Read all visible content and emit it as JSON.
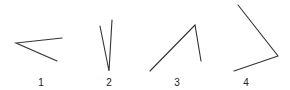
{
  "diagram": {
    "title": "",
    "stroke_color": "#333333",
    "angles": [
      {
        "label": "1",
        "vertex": [
          16,
          43
        ],
        "ray_a": [
          62,
          38
        ],
        "ray_b": [
          57,
          61
        ],
        "label_pos": [
          41,
          86
        ]
      },
      {
        "label": "2",
        "vertex": [
          109,
          71
        ],
        "ray_a": [
          100,
          26
        ],
        "ray_b": [
          112,
          20
        ],
        "label_pos": [
          109,
          86
        ]
      },
      {
        "label": "3",
        "vertex": [
          195,
          25
        ],
        "ray_a": [
          150,
          71
        ],
        "ray_b": [
          201,
          61
        ],
        "label_pos": [
          177,
          86
        ]
      },
      {
        "label": "4",
        "vertex": [
          278,
          56
        ],
        "ray_a": [
          238,
          5
        ],
        "ray_b": [
          234,
          71
        ],
        "label_pos": [
          246,
          86
        ]
      }
    ]
  }
}
